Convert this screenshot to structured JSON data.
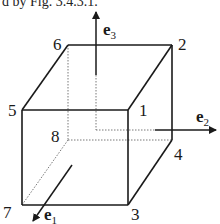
{
  "caption": "d by Fig. 3.4.3.1.",
  "vertices": {
    "v1": "1",
    "v2": "2",
    "v3": "3",
    "v4": "4",
    "v5": "5",
    "v6": "6",
    "v7": "7",
    "v8": "8"
  },
  "axes": {
    "e1": {
      "base": "e",
      "sub": "1"
    },
    "e2": {
      "base": "e",
      "sub": "2"
    },
    "e3": {
      "base": "e",
      "sub": "3"
    }
  },
  "colors": {
    "line": "#1a1a1a",
    "hidden": "#555555",
    "background": "#ffffff"
  }
}
